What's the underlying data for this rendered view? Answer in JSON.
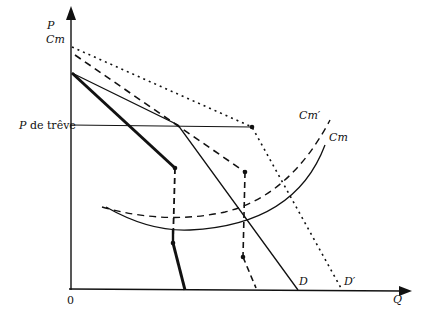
{
  "figure": {
    "axes": {
      "y_label_line1": "P",
      "y_label_line2": "Cm",
      "x_label": "Q",
      "origin_label": "0",
      "truce_price_label_italic": "P",
      "truce_price_label_rest": " de trêve"
    },
    "curves": {
      "demand": "D",
      "demand_prime": "D′",
      "marginal_cost": "Cm",
      "marginal_cost_prime": "Cm′"
    }
  }
}
